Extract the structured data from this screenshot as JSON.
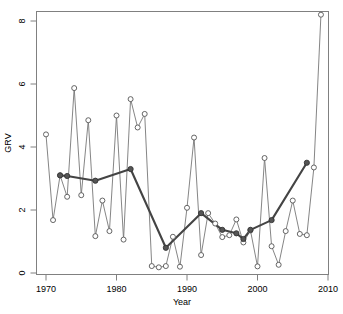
{
  "chart_data": {
    "type": "line",
    "title": "",
    "subtitle": "",
    "xlabel": "Year",
    "ylabel": "GRV",
    "xlim": [
      1968.5,
      2010.5
    ],
    "ylim": [
      0,
      8.4
    ],
    "xticks": [
      1970,
      1980,
      1990,
      2000,
      2010
    ],
    "xticklabels": [
      "1970",
      "1980",
      "1990",
      "2000",
      "2010"
    ],
    "yticks": [
      0,
      2,
      4,
      6,
      8
    ],
    "yticklabels": [
      "0",
      "2",
      "4",
      "6",
      "8"
    ],
    "grid": false,
    "legend": null,
    "annotations": [],
    "series": [
      {
        "name": "Annual GRV",
        "style": "thin-line-open-circles",
        "marker": "open-circle",
        "color": "#777777",
        "x": [
          1970,
          1971,
          1972,
          1973,
          1974,
          1975,
          1976,
          1977,
          1978,
          1979,
          1980,
          1981,
          1982,
          1983,
          1984,
          1985,
          1986,
          1987,
          1988,
          1989,
          1990,
          1991,
          1992,
          1993,
          1994,
          1995,
          1996,
          1997,
          1998,
          1999,
          2000,
          2001,
          2002,
          2003,
          2004,
          2005,
          2006,
          2007,
          2008,
          2009
        ],
        "y": [
          4.4,
          1.68,
          3.1,
          2.42,
          5.87,
          2.47,
          4.85,
          1.17,
          2.3,
          1.33,
          5.0,
          1.06,
          5.52,
          4.62,
          5.05,
          0.22,
          0.18,
          0.22,
          1.15,
          0.2,
          2.07,
          4.3,
          0.57,
          1.9,
          1.57,
          1.14,
          1.2,
          1.7,
          0.97,
          1.35,
          0.21,
          3.65,
          0.85,
          0.26,
          1.33,
          2.3,
          1.24,
          1.2,
          3.35,
          8.2
        ]
      },
      {
        "name": "Smoothed trend",
        "style": "bold-line-filled-circles",
        "marker": "filled-circle",
        "color": "#444444",
        "x": [
          1972,
          1973,
          1977,
          1982,
          1987,
          1992,
          1995,
          1997,
          1998,
          1999,
          2002,
          2007
        ],
        "y": [
          3.1,
          3.08,
          2.93,
          3.3,
          0.8,
          1.9,
          1.37,
          1.26,
          1.08,
          1.37,
          1.68,
          3.5
        ]
      }
    ]
  },
  "axes": {
    "x_axis_label": "Year",
    "y_axis_label": "GRV"
  }
}
